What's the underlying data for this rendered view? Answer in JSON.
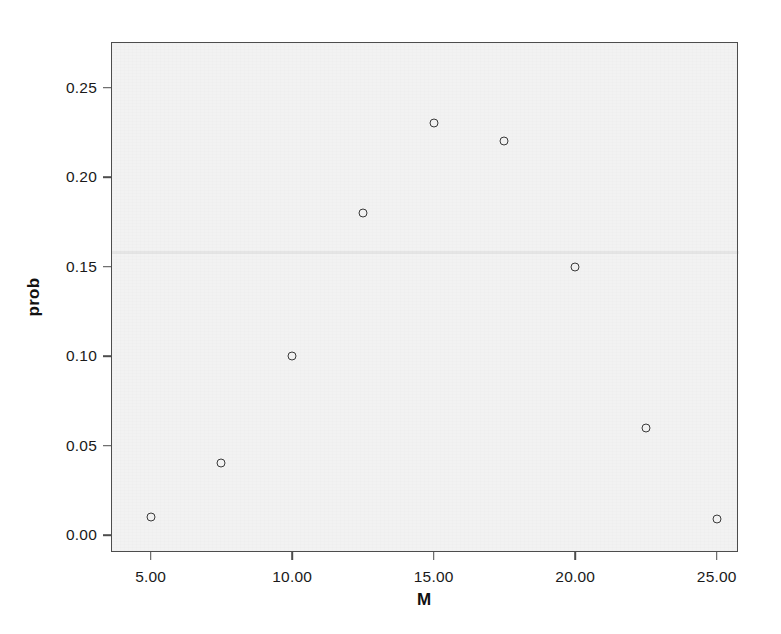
{
  "chart_data": {
    "type": "scatter",
    "title": "",
    "xlabel": "M",
    "ylabel": "prob",
    "x": [
      5,
      7.5,
      10,
      12.5,
      15,
      17.5,
      20,
      22.5,
      25
    ],
    "values": [
      0.01,
      0.04,
      0.1,
      0.18,
      0.23,
      0.22,
      0.15,
      0.06,
      0.009
    ],
    "series": [
      {
        "name": "prob",
        "points": [
          {
            "x": 5,
            "y": 0.01
          },
          {
            "x": 7.5,
            "y": 0.04
          },
          {
            "x": 10,
            "y": 0.1
          },
          {
            "x": 12.5,
            "y": 0.18
          },
          {
            "x": 15,
            "y": 0.23
          },
          {
            "x": 17.5,
            "y": 0.22
          },
          {
            "x": 20,
            "y": 0.15
          },
          {
            "x": 22.5,
            "y": 0.06
          },
          {
            "x": 25,
            "y": 0.009
          }
        ]
      }
    ],
    "xlim": [
      3.6,
      25.75
    ],
    "ylim": [
      -0.0095,
      0.2755
    ],
    "xticks": [
      5,
      10,
      15,
      20,
      25
    ],
    "yticks": [
      0.0,
      0.05,
      0.1,
      0.15,
      0.2,
      0.25
    ],
    "xtick_labels": [
      "5.00",
      "10.00",
      "15.00",
      "20.00",
      "25.00"
    ],
    "ytick_labels": [
      "0.00",
      "0.05",
      "0.10",
      "0.15",
      "0.20",
      "0.25"
    ],
    "grid": false,
    "legend": null,
    "marker": "open-circle",
    "marker_color": "#3a3a3a",
    "plot_background": "#f2f2f2",
    "figure_background": "#ffffff",
    "axis_color": "#4d4d4d"
  }
}
